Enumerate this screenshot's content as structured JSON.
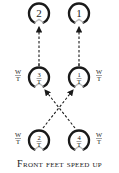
{
  "diagram": {
    "caption": "Front feet speed up",
    "top_row": [
      {
        "label": "2"
      },
      {
        "label": "1"
      }
    ],
    "middle_row": [
      {
        "numerator": "3",
        "denominator": "T",
        "side_label_num": "W",
        "side_label_den": "T"
      },
      {
        "numerator": "1",
        "denominator": "T",
        "side_label_num": "W",
        "side_label_den": "T"
      }
    ],
    "bottom_row": [
      {
        "numerator": "2",
        "denominator": "T",
        "side_label_num": "W",
        "side_label_den": "T"
      },
      {
        "numerator": "4",
        "denominator": "T",
        "side_label_num": "W",
        "side_label_den": "T"
      }
    ],
    "edges": [
      {
        "from": "middle-left",
        "to": "top-left",
        "style": "dashed-arrow"
      },
      {
        "from": "middle-right",
        "to": "top-right",
        "style": "dashed-arrow"
      },
      {
        "from": "bottom-left",
        "to": "middle-right",
        "style": "dashed-arrow"
      },
      {
        "from": "bottom-right",
        "to": "middle-left",
        "style": "dashed-arrow"
      }
    ],
    "colors": {
      "stroke": "#1a1a1a",
      "gap": "#bbbbbb"
    }
  }
}
